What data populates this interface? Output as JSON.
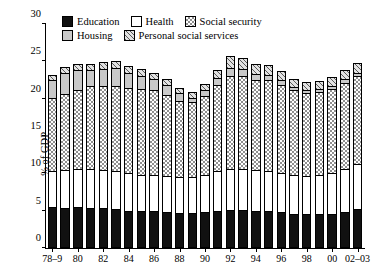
{
  "chart_data": {
    "type": "bar",
    "subtype": "stacked-bar",
    "title": "",
    "xlabel": "",
    "ylabel": "% of GDP",
    "ylim": [
      0,
      30
    ],
    "yticks": [
      0,
      5,
      10,
      15,
      20,
      25,
      30
    ],
    "grid": false,
    "legend_position": "top-left",
    "legend": [
      {
        "name": "Education",
        "swatch": "solid-black",
        "color": "#111111"
      },
      {
        "name": "Health",
        "swatch": "solid-white",
        "color": "#ffffff"
      },
      {
        "name": "Social security",
        "swatch": "checkered",
        "color": "#8f8f8f"
      },
      {
        "name": "Housing",
        "swatch": "light-gray",
        "color": "#c9c9c9"
      },
      {
        "name": "Personal social services",
        "swatch": "diagonal-hatch",
        "color": "#5a5a5a"
      }
    ],
    "categories": [
      "78-9",
      "79-80",
      "80-1",
      "81-2",
      "82-3",
      "83-4",
      "84-5",
      "85-6",
      "86-7",
      "87-8",
      "88-9",
      "89-90",
      "90-1",
      "91-2",
      "92-3",
      "93-4",
      "94-5",
      "95-6",
      "96-7",
      "97-8",
      "98-9",
      "99-00",
      "00-1",
      "01-2",
      "02-03"
    ],
    "tick_labels": [
      "78-9",
      "80",
      "82",
      "84",
      "86",
      "88",
      "90",
      "92",
      "94",
      "96",
      "98",
      "00",
      "02-03"
    ],
    "tick_label_indices": [
      0,
      2,
      4,
      6,
      8,
      10,
      12,
      14,
      16,
      18,
      20,
      22,
      24
    ],
    "series": [
      {
        "name": "Education",
        "values": [
          5.5,
          5.4,
          5.5,
          5.4,
          5.3,
          5.2,
          5.0,
          4.9,
          4.9,
          4.8,
          4.7,
          4.7,
          4.8,
          5.0,
          5.1,
          5.1,
          5.0,
          4.9,
          4.8,
          4.6,
          4.5,
          4.5,
          4.6,
          4.8,
          5.2
        ]
      },
      {
        "name": "Health",
        "values": [
          4.8,
          5.0,
          5.1,
          5.2,
          5.1,
          5.1,
          5.0,
          4.9,
          4.9,
          4.9,
          4.8,
          4.8,
          5.0,
          5.3,
          5.5,
          5.5,
          5.4,
          5.4,
          5.3,
          5.2,
          5.2,
          5.3,
          5.5,
          5.8,
          6.1
        ]
      },
      {
        "name": "Social security",
        "values": [
          9.8,
          10.2,
          10.5,
          11.1,
          11.3,
          11.4,
          11.4,
          11.5,
          11.3,
          10.8,
          10.2,
          10.0,
          10.6,
          11.6,
          12.4,
          12.4,
          12.1,
          12.2,
          11.8,
          11.3,
          11.1,
          11.1,
          11.2,
          11.5,
          11.7
        ]
      },
      {
        "name": "Housing",
        "values": [
          2.4,
          2.9,
          2.8,
          2.2,
          2.3,
          2.4,
          2.1,
          1.8,
          1.5,
          1.3,
          1.0,
          0.6,
          0.7,
          0.9,
          1.1,
          1.0,
          0.8,
          0.7,
          0.6,
          0.5,
          0.4,
          0.4,
          0.4,
          0.5,
          0.5
        ]
      },
      {
        "name": "Personal social services",
        "values": [
          0.7,
          0.8,
          0.8,
          0.8,
          0.9,
          0.9,
          0.9,
          0.9,
          0.9,
          0.9,
          0.8,
          0.8,
          0.9,
          1.0,
          1.6,
          1.4,
          1.3,
          1.3,
          1.2,
          1.1,
          1.1,
          1.1,
          1.2,
          1.3,
          1.3
        ]
      }
    ],
    "totals": [
      23.2,
      24.3,
      24.7,
      24.7,
      24.9,
      25.0,
      24.4,
      24.0,
      23.5,
      22.7,
      21.5,
      20.9,
      22.0,
      23.8,
      25.7,
      25.4,
      24.6,
      24.5,
      23.7,
      22.7,
      22.3,
      22.4,
      22.9,
      23.9,
      24.8
    ]
  }
}
